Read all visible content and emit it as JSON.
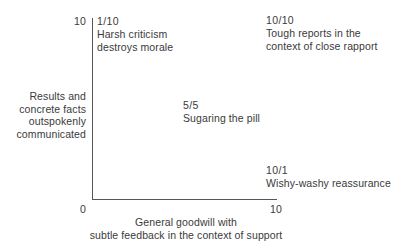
{
  "chart_data": {
    "type": "scatter",
    "title": "",
    "xlabel": "General goodwill with subtle feedback in the context of support",
    "ylabel": "Results and concrete facts outspokenly communicated",
    "xlim": [
      0,
      10
    ],
    "ylim": [
      0,
      10
    ],
    "xticks": [
      "0",
      "10"
    ],
    "yticks": [
      "10"
    ],
    "grid": false,
    "legend": false,
    "points": [
      {
        "coord": "1/10",
        "x": 1,
        "y": 10,
        "label": "Harsh criticism destroys morale"
      },
      {
        "coord": "10/10",
        "x": 10,
        "y": 10,
        "label": "Tough reports in the context of close rapport"
      },
      {
        "coord": "5/5",
        "x": 5,
        "y": 5,
        "label": "Sugaring the pill"
      },
      {
        "coord": "10/1",
        "x": 10,
        "y": 1,
        "label": "Wishy-washy reassurance"
      }
    ]
  },
  "axes": {
    "y_tick_top": "10",
    "x_tick_left": "0",
    "x_tick_right": "10",
    "y_caption_lines": [
      "Results and",
      "concrete facts",
      "outspokenly",
      "communicated"
    ],
    "x_caption_lines": [
      "General goodwill with",
      "subtle feedback in the context of support"
    ]
  },
  "annotations": {
    "top_left": {
      "coord": "1/10",
      "lines": [
        "Harsh criticism",
        "destroys morale"
      ]
    },
    "top_right": {
      "coord": "10/10",
      "lines": [
        "Tough reports in the",
        "context of close rapport"
      ]
    },
    "center": {
      "coord": "5/5",
      "lines": [
        "Sugaring the pill"
      ]
    },
    "bottom_right": {
      "coord": "10/1",
      "lines": [
        "Wishy-washy reassurance"
      ]
    }
  },
  "colors": {
    "background": "#ffffff",
    "text": "#3a3a3c",
    "axis": "#55565a"
  }
}
